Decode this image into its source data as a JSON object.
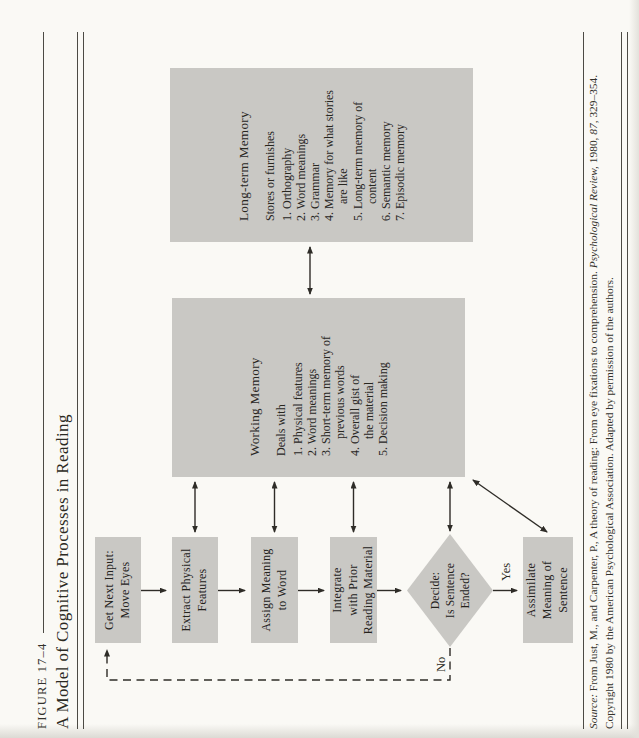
{
  "figure": {
    "label": "FIGURE 17–4",
    "title": "A Model of Cognitive Processes in Reading"
  },
  "process_boxes": {
    "get_next_input": "Get Next Input:\nMove Eyes",
    "extract_features": "Extract Physical\nFeatures",
    "assign_meaning": "Assign Meaning\nto Word",
    "integrate": "Integrate\nwith Prior\nReading Material",
    "decide": "Decide:\nIs Sentence\nEnded?",
    "assimilate": "Assimilate\nMeaning of\nSentence"
  },
  "branch_labels": {
    "yes": "Yes",
    "no": "No"
  },
  "working_memory": {
    "title": "Working Memory",
    "subtitle": "Deals with",
    "items": [
      "1. Physical features",
      "2. Word meanings",
      "3. Short-term memory of\nprevious words",
      "4. Overall gist of\nthe material",
      "5. Decision making"
    ]
  },
  "long_term_memory": {
    "title": "Long-term Memory",
    "subtitle": "Stores or furnishes",
    "items": [
      "1. Orthography",
      "2. Word meanings",
      "3. Grammar",
      "4. Memory for what stories\nare like",
      "5. Long-term memory of\ncontent",
      "6. Semantic memory",
      "7. Episodic memory"
    ]
  },
  "source": {
    "prefix": "Source:",
    "text1": " From Just, M., and Carpenter, P., A theory of reading: From eye fixations to comprehension. ",
    "journal": "Psychological Review,",
    "text2": " 1980, ",
    "volume": "87",
    "text3": ", 329–354.",
    "line2": "Copyright 1980 by the American Psychological Association. Adapted by permission of the authors."
  },
  "colors": {
    "box_fill": "#c9c8c4",
    "page_bg": "#faf9f5",
    "line": "#2e2c27"
  }
}
